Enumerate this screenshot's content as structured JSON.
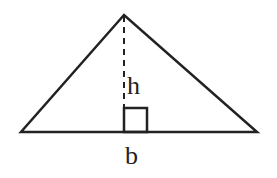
{
  "diagram": {
    "type": "triangle-area",
    "labels": {
      "height": "h",
      "base": "b"
    },
    "geometry": {
      "apex": [
        124,
        15
      ],
      "base_left": [
        21,
        132
      ],
      "base_right": [
        257,
        132
      ],
      "height_foot": [
        124,
        132
      ],
      "right_angle_marker_size": 23
    },
    "colors": {
      "stroke": "#222222",
      "background": "#ffffff"
    }
  }
}
